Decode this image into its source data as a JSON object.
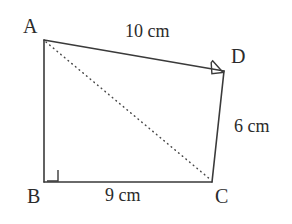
{
  "figure": {
    "shape_type": "quadrilateral",
    "stroke_color": "#3a3a3a",
    "text_color": "#2b2b2b",
    "background_color": "#ffffff",
    "vertices": [
      {
        "name": "A",
        "label": "A",
        "x": 44,
        "y": 40
      },
      {
        "name": "B",
        "label": "B",
        "x": 44,
        "y": 182
      },
      {
        "name": "C",
        "label": "C",
        "x": 212,
        "y": 182
      },
      {
        "name": "D",
        "label": "D",
        "x": 224,
        "y": 71
      }
    ],
    "edges": [
      {
        "name": "edge-AD",
        "from": "A",
        "to": "D",
        "style": "solid",
        "measure": "10 cm"
      },
      {
        "name": "edge-DC",
        "from": "D",
        "to": "C",
        "style": "solid",
        "measure": "6 cm"
      },
      {
        "name": "edge-CB",
        "from": "C",
        "to": "B",
        "style": "solid",
        "measure": "9 cm"
      },
      {
        "name": "edge-BA",
        "from": "B",
        "to": "A",
        "style": "solid",
        "measure": ""
      }
    ],
    "diagonal": {
      "name": "diagonal-AC",
      "from": "A",
      "to": "C",
      "style": "dotted"
    },
    "right_angles": [
      {
        "at": "B",
        "name": "right-angle-B"
      },
      {
        "at": "D",
        "name": "right-angle-D"
      }
    ],
    "labels": {
      "vertex_a": "A",
      "vertex_b": "B",
      "vertex_c": "C",
      "vertex_d": "D",
      "side_ad": "10 cm",
      "side_dc": "6 cm",
      "side_bc": "9 cm"
    }
  }
}
